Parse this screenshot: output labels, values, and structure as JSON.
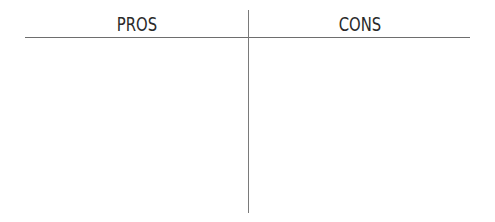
{
  "chart": {
    "columns": [
      {
        "heading": "PROS",
        "items": []
      },
      {
        "heading": "CONS",
        "items": []
      }
    ]
  },
  "colors": {
    "background": "#ffffff",
    "text": "#2a2a2a",
    "rule": "#6e6e6e"
  }
}
